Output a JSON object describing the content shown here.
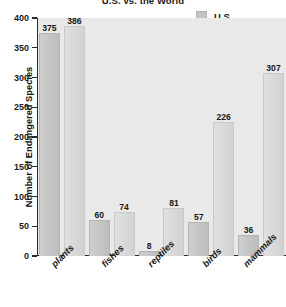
{
  "chart_data": {
    "type": "bar",
    "title": "U.S. vs. the World",
    "xlabel": "",
    "ylabel": "Number of Endangered Species",
    "categories": [
      "plants",
      "fishes",
      "reptiles",
      "birds",
      "mammals"
    ],
    "series": [
      {
        "name": "U.S.",
        "values": [
          375,
          60,
          8,
          57,
          36
        ],
        "color": "#c4c4c4"
      },
      {
        "name": "World",
        "values": [
          386,
          74,
          81,
          226,
          307
        ],
        "color": "#d8d8d8"
      }
    ],
    "ylim": [
      0,
      400
    ],
    "yticks": [
      0,
      50,
      100,
      150,
      200,
      250,
      300,
      350,
      400
    ],
    "ytick_labels": [
      "0",
      "50",
      "100",
      "150",
      "200",
      "250",
      "300",
      "350",
      "400"
    ],
    "grid": false,
    "legend_position": "top-right",
    "data_labels": true,
    "plot_background": "#e9e9e9",
    "axis_color": "#2b2b2b"
  }
}
